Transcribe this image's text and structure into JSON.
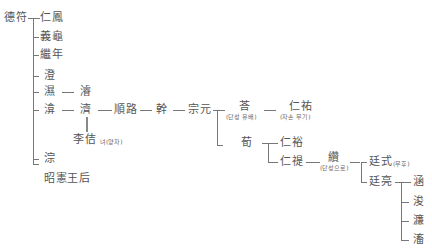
{
  "diagram": {
    "type": "genealogy-tree",
    "root": "德符",
    "nodes": {
      "root": "德符",
      "c1": "仁鳳",
      "c2": "義龜",
      "c3": "繼年",
      "c4": "澄",
      "c5": "濕",
      "c5_1": "濬",
      "c6": "渰",
      "c6_1": "濟",
      "c6_1_a": "李佶",
      "c6_1_a_note": "녀(양자)",
      "c6_2": "順路",
      "c6_3": "幹",
      "c6_4": "宗元",
      "c6_4_a": "荅",
      "c6_4_a_note": "(단성 유배)",
      "c6_4_a_1": "仁祐",
      "c6_4_a_1_note": "(자손 무기)",
      "c6_4_b": "荀",
      "c6_4_b_1": "仁裕",
      "c6_4_b_2": "仁禔",
      "c6_4_b_2_1": "纘",
      "c6_4_b_2_1_note": "(단성으로)",
      "c6_4_b_2_1_a": "廷式",
      "c6_4_b_2_1_a_note": "(무후)",
      "c6_4_b_2_1_b": "廷亮",
      "g1": "涵",
      "g2": "浚",
      "g3": "濂",
      "g4": "滀",
      "c7": "淙",
      "c8": "昭憲王后"
    }
  }
}
